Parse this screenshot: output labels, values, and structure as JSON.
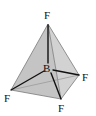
{
  "diagram": {
    "central_atom": {
      "label": "B",
      "x": 47,
      "y": 69
    },
    "ligands": [
      {
        "label": "F",
        "x": 48,
        "y": 24,
        "lx": 44,
        "ly": 19
      },
      {
        "label": "F",
        "x": 11,
        "y": 90,
        "lx": 4,
        "ly": 102
      },
      {
        "label": "F",
        "x": 79,
        "y": 75,
        "lx": 82,
        "ly": 81
      },
      {
        "label": "F",
        "x": 61,
        "y": 99,
        "lx": 58,
        "ly": 112
      }
    ],
    "colors": {
      "face": "#c9c9c9",
      "edge": "#6e6e6e",
      "bond": "#111111"
    }
  }
}
